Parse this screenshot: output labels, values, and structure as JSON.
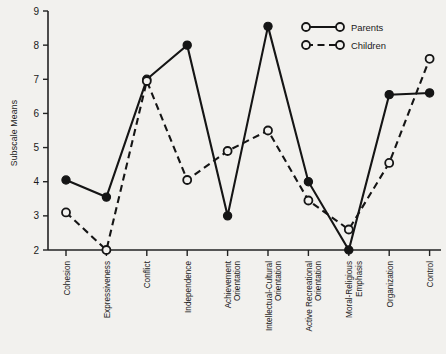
{
  "chart_data": {
    "type": "line",
    "title": "",
    "xlabel": "",
    "ylabel": "Subscale Means",
    "ylim": [
      2,
      9
    ],
    "yticks": [
      2,
      3,
      4,
      5,
      6,
      7,
      8,
      9
    ],
    "grid": false,
    "legend_position": "top-right",
    "categories": [
      "Cohesion",
      "Expressiveness",
      "Conflict",
      "Independence",
      "Achievement Orientation",
      "Intellectual-Cultural Orientation",
      "Active Recreational Orientation",
      "Moral-Religious Emphasis",
      "Organization",
      "Control"
    ],
    "category_lines": [
      [
        "Cohesion"
      ],
      [
        "Expressiveness"
      ],
      [
        "Conflict"
      ],
      [
        "Independence"
      ],
      [
        "Achievement",
        "Orientation"
      ],
      [
        "Intellectual-Cultural",
        "Orientation"
      ],
      [
        "Active Recreational",
        "Orientation"
      ],
      [
        "Moral-Religious",
        "Emphasis"
      ],
      [
        "Organization"
      ],
      [
        "Control"
      ]
    ],
    "series": [
      {
        "name": "Parents",
        "marker": "filled-circle",
        "line": "solid",
        "color": "#151515",
        "values": [
          4.05,
          3.55,
          7.0,
          8.0,
          3.0,
          8.55,
          4.0,
          2.0,
          6.55,
          6.6
        ]
      },
      {
        "name": "Children",
        "marker": "open-circle",
        "line": "dashed",
        "color": "#151515",
        "values": [
          3.1,
          2.0,
          6.95,
          4.05,
          4.9,
          5.5,
          3.45,
          2.6,
          4.55,
          7.6
        ]
      }
    ]
  },
  "axis": {
    "y_title": "Subscale Means",
    "y_tick_labels": [
      "9",
      "8",
      "7",
      "6",
      "5",
      "4",
      "3",
      "2"
    ]
  },
  "legend": {
    "items": [
      {
        "label": "Parents",
        "style": "solid"
      },
      {
        "label": "Children",
        "style": "dashed"
      }
    ]
  },
  "colors": {
    "background": "#f2f1ee",
    "ink": "#151515",
    "axis": "#222222"
  }
}
